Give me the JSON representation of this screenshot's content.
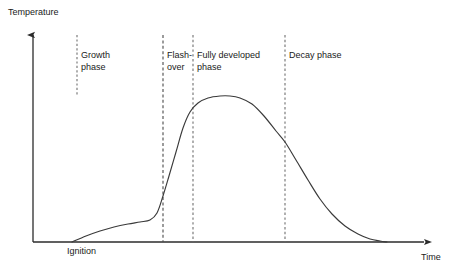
{
  "diagram": {
    "background_color": "#ffffff",
    "line_color": "#3a3a3a",
    "axis_color": "#2b2b2b",
    "text_color": "#1a1a1a"
  },
  "axes": {
    "y_label": "Temperature",
    "x_label": "Time",
    "origin_label": "Ignition"
  },
  "phases": [
    {
      "key": "growth",
      "label_line1": "Growth",
      "label_line2": "phase",
      "divider_x": 77,
      "divider_top": 35,
      "divider_bottom": 95
    },
    {
      "key": "flashover",
      "label_line1": "Flash-",
      "label_line2": "over",
      "divider_x": 163,
      "divider_top": 35,
      "divider_bottom": 242
    },
    {
      "key": "fully",
      "label_line1": "Fully developed",
      "label_line2": "phase",
      "divider_x": 193,
      "divider_top": 35,
      "divider_bottom": 242
    },
    {
      "key": "decay",
      "label_line1": "Decay phase",
      "label_line2": "",
      "divider_x": 285,
      "divider_top": 35,
      "divider_bottom": 242
    }
  ],
  "chart_data": {
    "type": "line",
    "xlabel": "Time",
    "ylabel": "Temperature",
    "grid": false,
    "legend": false,
    "axis_ticks": [],
    "annotations": [
      "Ignition",
      "Growth phase",
      "Flash-over",
      "Fully developed phase",
      "Decay phase"
    ],
    "series": [
      {
        "name": "Temperature",
        "description": "Ignition, slow growth, flashover spike, fully developed plateau, decay",
        "points": [
          [
            72,
            242
          ],
          [
            86,
            236
          ],
          [
            100,
            231
          ],
          [
            114,
            227
          ],
          [
            128,
            224
          ],
          [
            140,
            222
          ],
          [
            150,
            220
          ],
          [
            157,
            213
          ],
          [
            163,
            196
          ],
          [
            169,
            176
          ],
          [
            176,
            152
          ],
          [
            183,
            128
          ],
          [
            190,
            112
          ],
          [
            198,
            103
          ],
          [
            208,
            98
          ],
          [
            220,
            96
          ],
          [
            230,
            96
          ],
          [
            240,
            98
          ],
          [
            252,
            104
          ],
          [
            264,
            116
          ],
          [
            276,
            131
          ],
          [
            285,
            142
          ],
          [
            296,
            160
          ],
          [
            308,
            180
          ],
          [
            320,
            199
          ],
          [
            332,
            214
          ],
          [
            345,
            226
          ],
          [
            358,
            234
          ],
          [
            370,
            239
          ],
          [
            380,
            241
          ],
          [
            387,
            242
          ]
        ]
      }
    ]
  }
}
